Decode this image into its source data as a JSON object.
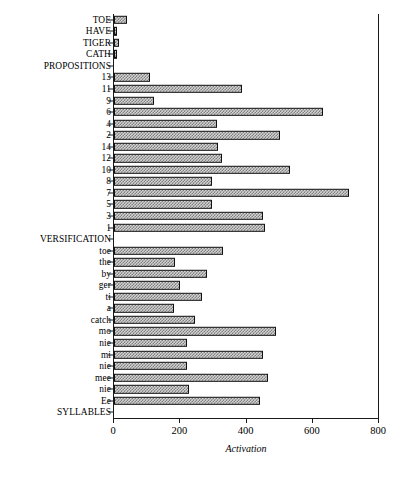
{
  "chart_data": {
    "type": "bar",
    "orientation": "horizontal",
    "title": "",
    "xlabel": "Activation",
    "ylabel": "",
    "xlim": [
      0,
      800
    ],
    "xticks": [
      0,
      200,
      400,
      600,
      800
    ],
    "xtick_labels": [
      "0",
      "200",
      "400",
      "600",
      "800"
    ],
    "grid": false,
    "legend": null,
    "categories": [
      "TOE",
      "HAVE",
      "TIGER",
      "CATH",
      "PROPOSITIONS",
      "13",
      "11",
      "9",
      "6",
      "4",
      "2",
      "14",
      "12",
      "10",
      "8",
      "7",
      "5",
      "3",
      "1",
      "VERSIFICATION",
      "toe",
      "the",
      "by",
      "ger",
      "ti",
      "a",
      "catch",
      "mo",
      "nie",
      "mi",
      "nie",
      "mee",
      "nie",
      "Ee",
      "SYLLABLES"
    ],
    "values": [
      40,
      10,
      16,
      10,
      0,
      110,
      385,
      120,
      630,
      310,
      500,
      315,
      325,
      530,
      295,
      710,
      295,
      450,
      455,
      0,
      330,
      185,
      280,
      200,
      265,
      180,
      245,
      490,
      220,
      450,
      220,
      465,
      225,
      440,
      0
    ]
  }
}
